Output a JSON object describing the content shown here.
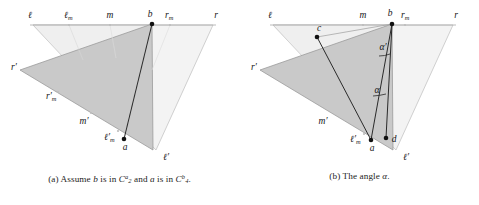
{
  "figure": {
    "panels": [
      {
        "id": "panel-a",
        "caption_prefix": "(a)",
        "caption_text_1": "Assume",
        "caption_math_b": "b",
        "caption_text_2": "is in",
        "caption_set_1_base": "C",
        "caption_set_1_sub": "2",
        "caption_set_1_sup": "a",
        "caption_text_3": "and",
        "caption_math_a": "a",
        "caption_text_4": "is in",
        "caption_set_2_base": "C",
        "caption_set_2_sub": "4",
        "caption_set_2_sup": "b",
        "caption_period": ".",
        "labels": {
          "l": "ℓ",
          "l_m_base": "ℓ",
          "l_m_sub": "m",
          "m": "m",
          "b": "b",
          "r_m_base": "r",
          "r_m_sub": "m",
          "r": "r",
          "r_prime": "r′",
          "r_m_prime_base": "r′",
          "r_m_prime_sub": "m",
          "m_prime": "m′",
          "l_m_prime_base": "ℓ′",
          "l_m_prime_sub": "m",
          "a": "a",
          "l_prime": "ℓ′"
        }
      },
      {
        "id": "panel-b",
        "caption_prefix": "(b)",
        "caption_text_1": "The angle",
        "caption_math_alpha": "α",
        "caption_period": ".",
        "labels": {
          "l": "ℓ",
          "m": "m",
          "b": "b",
          "r_m_base": "r",
          "r_m_sub": "m",
          "r": "r",
          "c": "c",
          "alpha_prime": "α′",
          "alpha": "α",
          "r_prime": "r′",
          "m_prime": "m′",
          "l_m_prime_base": "ℓ′",
          "l_m_prime_sub": "m",
          "a": "a",
          "d": "d",
          "l_prime": "ℓ′"
        }
      }
    ],
    "colors": {
      "light_fill": "#f2f2f2",
      "dark_fill": "#c9c9c9",
      "stroke_light": "#b8b8b8",
      "stroke_dark": "#6e6e6e",
      "ink": "#161616"
    }
  }
}
